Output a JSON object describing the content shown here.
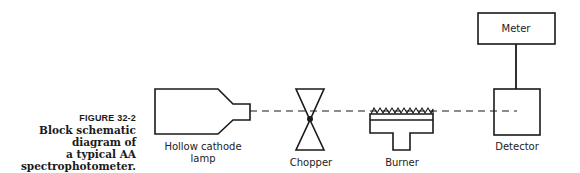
{
  "caption": {
    "figure_number": "FIGURE 32-2",
    "lines": [
      "Block schematic diagram of",
      "a typical AA",
      "spectrophotometer."
    ]
  },
  "components": {
    "lamp": {
      "label_line1": "Hollow cathode",
      "label_line2": "lamp"
    },
    "chopper": {
      "label": "Chopper"
    },
    "burner": {
      "label": "Burner"
    },
    "detector": {
      "label": "Detector"
    },
    "meter": {
      "label": "Meter"
    }
  },
  "colors": {
    "stroke": "#1a1a1a",
    "background": "#ffffff"
  }
}
